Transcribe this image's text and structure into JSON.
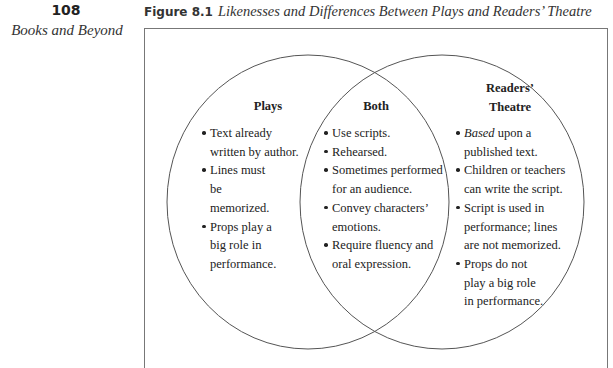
{
  "page": {
    "number": "108",
    "running_head": "Books and Beyond"
  },
  "figure": {
    "label": "Figure 8.1",
    "title": "Likenesses and Differences Between Plays and Readers’ Theatre"
  },
  "venn": {
    "left": {
      "heading": "Plays",
      "items": [
        "Text already written by author.",
        "Lines must be memorized.",
        "Props play a big role in performance."
      ]
    },
    "center": {
      "heading": "Both",
      "items": [
        "Use scripts.",
        "Rehearsed.",
        "Sometimes performed for an audience.",
        "Convey characters’ emotions.",
        "Require fluency and oral expression."
      ]
    },
    "right": {
      "heading_line1": "Readers’",
      "heading_line2": "Theatre",
      "items": [
        {
          "emphasis": "Based",
          "rest": " upon a published text."
        },
        {
          "text": "Children or teachers can write the script."
        },
        {
          "text": "Script is used in performance; lines are not memorized."
        },
        {
          "text": "Props do not play a big role in performance."
        }
      ]
    },
    "colors": {
      "circle_stroke": "#555555",
      "box_border": "#777777",
      "text": "#222222"
    }
  }
}
